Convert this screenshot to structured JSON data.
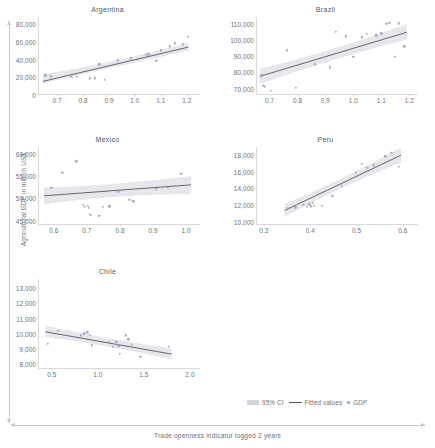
{
  "figure": {
    "ylabel": "Agricultural GDP in million US$",
    "xlabel": "Trade openness indicator logged 2 years"
  },
  "legend": {
    "ci_label": "95% CI",
    "fitted_label": "Fitted values",
    "gdp_label": "GDP"
  },
  "colors": {
    "point": "#9aa0b4",
    "line": "#55555c",
    "ci_band": "#d2d4dc",
    "axis": "#d8d8dd",
    "text": "#6f6f76"
  },
  "chart_data": {
    "type": "scatter",
    "title": "",
    "xlabel": "Trade openness indicator logged 2 years",
    "ylabel": "Agricultural GDP in million US$",
    "grid": false,
    "legend_position": "bottom-right",
    "panels": [
      {
        "name": "argentina",
        "title": "Argentina",
        "xlim": [
          0.63,
          1.255
        ],
        "ylim": [
          0,
          88000
        ],
        "xticks": [
          "0.7",
          "0.8",
          "0.9",
          "1.0",
          "1.1",
          "1.2"
        ],
        "xtick_values": [
          0.7,
          0.8,
          0.9,
          1.0,
          1.1,
          1.2
        ],
        "yticks": [
          "0",
          "20,000",
          "40,000",
          "60,000",
          "80,000"
        ],
        "ytick_values": [
          0,
          20000,
          40000,
          60000,
          80000
        ],
        "points": [
          {
            "x": 0.655,
            "y": 22100
          },
          {
            "x": 0.675,
            "y": 21300
          },
          {
            "x": 0.755,
            "y": 20800
          },
          {
            "x": 0.775,
            "y": 20400
          },
          {
            "x": 0.825,
            "y": 18900
          },
          {
            "x": 0.845,
            "y": 18700
          },
          {
            "x": 0.862,
            "y": 34600
          },
          {
            "x": 0.885,
            "y": 17200
          },
          {
            "x": 0.935,
            "y": 39200
          },
          {
            "x": 0.985,
            "y": 41600
          },
          {
            "x": 1.0,
            "y": 39900
          },
          {
            "x": 1.012,
            "y": 40400
          },
          {
            "x": 1.042,
            "y": 45500
          },
          {
            "x": 1.052,
            "y": 46100
          },
          {
            "x": 1.082,
            "y": 38800
          },
          {
            "x": 1.1,
            "y": 50300
          },
          {
            "x": 1.135,
            "y": 54800
          },
          {
            "x": 1.155,
            "y": 58400
          },
          {
            "x": 1.185,
            "y": 57200
          },
          {
            "x": 1.205,
            "y": 65700
          }
        ],
        "fit": {
          "x0": 0.645,
          "y0": 14400,
          "x1": 1.21,
          "y1": 53600
        },
        "ci": {
          "x0": 0.645,
          "lo0": 12200,
          "hi0": 22500,
          "xm": 0.93,
          "lom": 31600,
          "him": 36200,
          "x1": 1.21,
          "lo1": 49500,
          "hi1": 58600
        }
      },
      {
        "name": "brazil",
        "title": "Brazil",
        "xlim": [
          0.655,
          1.235
        ],
        "ylim": [
          66000,
          114500
        ],
        "xticks": [
          "0.7",
          "0.8",
          "0.9",
          "1.0",
          "1.1",
          "1.2"
        ],
        "xtick_values": [
          0.7,
          0.8,
          0.9,
          1.0,
          1.1,
          1.2
        ],
        "yticks": [
          "70,000",
          "80,000",
          "90,000",
          "100,000",
          "110,000"
        ],
        "ytick_values": [
          70000,
          80000,
          90000,
          100000,
          110000
        ],
        "points": [
          {
            "x": 0.672,
            "y": 78600
          },
          {
            "x": 0.678,
            "y": 71900
          },
          {
            "x": 0.682,
            "y": 71000
          },
          {
            "x": 0.705,
            "y": 68600
          },
          {
            "x": 0.762,
            "y": 93800
          },
          {
            "x": 0.793,
            "y": 70400
          },
          {
            "x": 0.862,
            "y": 85200
          },
          {
            "x": 0.915,
            "y": 83200
          },
          {
            "x": 0.938,
            "y": 105300
          },
          {
            "x": 0.972,
            "y": 102400
          },
          {
            "x": 1.0,
            "y": 89800
          },
          {
            "x": 1.03,
            "y": 101800
          },
          {
            "x": 1.048,
            "y": 104200
          },
          {
            "x": 1.082,
            "y": 103200
          },
          {
            "x": 1.1,
            "y": 104400
          },
          {
            "x": 1.118,
            "y": 110300
          },
          {
            "x": 1.128,
            "y": 110800
          },
          {
            "x": 1.148,
            "y": 89700
          },
          {
            "x": 1.162,
            "y": 110500
          },
          {
            "x": 1.182,
            "y": 96300
          }
        ],
        "fit": {
          "x0": 0.665,
          "y0": 77100,
          "x1": 1.195,
          "y1": 104900
        },
        "ci": {
          "x0": 0.665,
          "lo0": 72300,
          "hi0": 81700,
          "xm": 0.93,
          "lom": 88600,
          "him": 93200,
          "x1": 1.195,
          "lo1": 100300,
          "hi1": 110100
        }
      },
      {
        "name": "mexico",
        "title": "Mexico",
        "xlim": [
          0.555,
          1.045
        ],
        "ylim": [
          44000,
          61500
        ],
        "xticks": [
          "0.6",
          "0.7",
          "0.8",
          "0.9",
          "1.0"
        ],
        "xtick_values": [
          0.6,
          0.7,
          0.8,
          0.9,
          1.0
        ],
        "yticks": [
          "45,000",
          "50,000",
          "55,000",
          "60,000"
        ],
        "ytick_values": [
          45000,
          50000,
          55000,
          60000
        ],
        "points": [
          {
            "x": 0.592,
            "y": 52400
          },
          {
            "x": 0.625,
            "y": 55700
          },
          {
            "x": 0.668,
            "y": 58300
          },
          {
            "x": 0.688,
            "y": 48500
          },
          {
            "x": 0.693,
            "y": 48100
          },
          {
            "x": 0.702,
            "y": 48300
          },
          {
            "x": 0.706,
            "y": 47900
          },
          {
            "x": 0.71,
            "y": 46300
          },
          {
            "x": 0.737,
            "y": 46000
          },
          {
            "x": 0.748,
            "y": 48100
          },
          {
            "x": 0.768,
            "y": 48200
          },
          {
            "x": 0.795,
            "y": 51400
          },
          {
            "x": 0.828,
            "y": 49700
          },
          {
            "x": 0.84,
            "y": 49300
          },
          {
            "x": 0.91,
            "y": 52100
          },
          {
            "x": 0.945,
            "y": 52300
          },
          {
            "x": 0.985,
            "y": 55500
          }
        ],
        "fit": {
          "x0": 0.57,
          "y0": 50400,
          "x1": 1.018,
          "y1": 52900
        },
        "ci": {
          "x0": 0.57,
          "lo0": 48500,
          "hi0": 52300,
          "xm": 0.79,
          "lom": 50700,
          "him": 52700,
          "x1": 1.018,
          "lo1": 50800,
          "hi1": 54900
        }
      },
      {
        "name": "peru",
        "title": "Peru",
        "xlim": [
          0.285,
          0.635
        ],
        "ylim": [
          9600,
          19000
        ],
        "xticks": [
          "0.3",
          "0.4",
          "0.5",
          "0.6"
        ],
        "xtick_values": [
          0.3,
          0.4,
          0.5,
          0.6
        ],
        "yticks": [
          "10,000",
          "12,000",
          "14,000",
          "16,000",
          "18,000"
        ],
        "ytick_values": [
          10000,
          12000,
          14000,
          16000,
          18000
        ],
        "points": [
          {
            "x": 0.352,
            "y": 11700
          },
          {
            "x": 0.368,
            "y": 11750
          },
          {
            "x": 0.385,
            "y": 12050
          },
          {
            "x": 0.392,
            "y": 11800
          },
          {
            "x": 0.398,
            "y": 12100
          },
          {
            "x": 0.401,
            "y": 11850
          },
          {
            "x": 0.405,
            "y": 12250
          },
          {
            "x": 0.408,
            "y": 11900
          },
          {
            "x": 0.425,
            "y": 11900
          },
          {
            "x": 0.448,
            "y": 13100
          },
          {
            "x": 0.468,
            "y": 14300
          },
          {
            "x": 0.498,
            "y": 15900
          },
          {
            "x": 0.512,
            "y": 17000
          },
          {
            "x": 0.523,
            "y": 16500
          },
          {
            "x": 0.538,
            "y": 16800
          },
          {
            "x": 0.562,
            "y": 17900
          },
          {
            "x": 0.575,
            "y": 18300
          },
          {
            "x": 0.592,
            "y": 16600
          }
        ],
        "fit": {
          "x0": 0.345,
          "y0": 11250,
          "x1": 0.598,
          "y1": 18000
        },
        "ci": {
          "x0": 0.345,
          "lo0": 10500,
          "hi0": 12000,
          "xm": 0.47,
          "lom": 14200,
          "him": 15000,
          "x1": 0.598,
          "lo1": 17100,
          "hi1": 18900
        }
      },
      {
        "name": "chile",
        "title": "Chile",
        "xlim": [
          0.36,
          2.12
        ],
        "ylim": [
          7700,
          13600
        ],
        "xticks": [
          "0.5",
          "1.0",
          "1.5",
          "2.0"
        ],
        "xtick_values": [
          0.5,
          1.0,
          1.5,
          2.0
        ],
        "yticks": [
          "8,000",
          "9,000",
          "10,000",
          "11,000",
          "12,000",
          "13,000"
        ],
        "ytick_values": [
          8000,
          9000,
          10000,
          11000,
          12000,
          13000
        ],
        "points": [
          {
            "x": 0.455,
            "y": 9350
          },
          {
            "x": 0.565,
            "y": 10200
          },
          {
            "x": 0.815,
            "y": 9900
          },
          {
            "x": 0.845,
            "y": 10050
          },
          {
            "x": 0.86,
            "y": 10000
          },
          {
            "x": 0.885,
            "y": 10100
          },
          {
            "x": 0.915,
            "y": 9950
          },
          {
            "x": 0.935,
            "y": 9250
          },
          {
            "x": 1.12,
            "y": 9450
          },
          {
            "x": 1.165,
            "y": 9150
          },
          {
            "x": 1.2,
            "y": 9500
          },
          {
            "x": 1.21,
            "y": 9300
          },
          {
            "x": 1.225,
            "y": 9200
          },
          {
            "x": 1.24,
            "y": 8700
          },
          {
            "x": 1.3,
            "y": 9900
          },
          {
            "x": 1.33,
            "y": 9650
          },
          {
            "x": 1.365,
            "y": 9300
          },
          {
            "x": 1.46,
            "y": 8500
          },
          {
            "x": 1.77,
            "y": 9150
          }
        ],
        "fit": {
          "x0": 0.43,
          "y0": 10100,
          "x1": 1.81,
          "y1": 8620
        },
        "ci": {
          "x0": 0.43,
          "lo0": 9750,
          "hi0": 10500,
          "xm": 1.1,
          "lom": 9250,
          "him": 9600,
          "x1": 1.81,
          "lo1": 8250,
          "hi1": 9000
        }
      }
    ]
  }
}
